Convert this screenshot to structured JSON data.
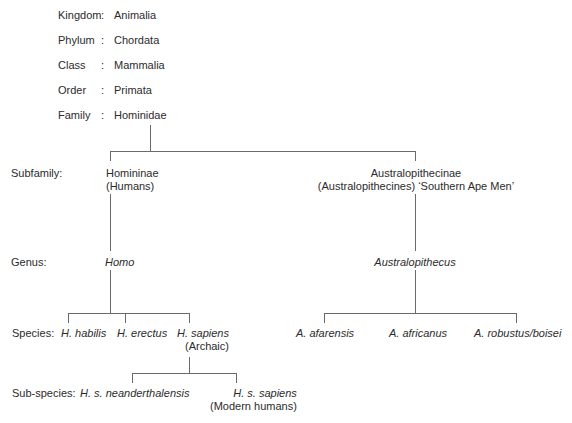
{
  "taxonomy": {
    "rows": [
      {
        "rank": "Kingdom",
        "sep": ":",
        "value": "Animalia"
      },
      {
        "rank": "Phylum",
        "sep": ":",
        "value": "Chordata"
      },
      {
        "rank": "Class",
        "sep": ":",
        "value": "Mammalia"
      },
      {
        "rank": "Order",
        "sep": ":",
        "value": "Primata"
      },
      {
        "rank": "Family",
        "sep": ":",
        "value": "Hominidae"
      }
    ]
  },
  "levels": {
    "subfamily": "Subfamily:",
    "genus": "Genus:",
    "species": "Species:",
    "subspecies": "Sub-species:"
  },
  "tree": {
    "subfamilies": [
      {
        "name": "Homininae",
        "note": "(Humans)"
      },
      {
        "name": "Australopithecinae",
        "note": "(Australopithecines) ‘Southern Ape Men’"
      }
    ],
    "genera": [
      "Homo",
      "Australopithecus"
    ],
    "homo_species": [
      {
        "name": "H. habilis"
      },
      {
        "name": "H. erectus"
      },
      {
        "name": "H. sapiens",
        "note": "(Archaic)"
      }
    ],
    "australopithecus_species": [
      {
        "name": "A. afarensis"
      },
      {
        "name": "A. africanus"
      },
      {
        "name": "A. robustus/boisei"
      }
    ],
    "sapiens_subspecies": [
      {
        "name": "H. s. neanderthalensis"
      },
      {
        "name": "H. s. sapiens",
        "note": "(Modern humans)"
      }
    ]
  }
}
